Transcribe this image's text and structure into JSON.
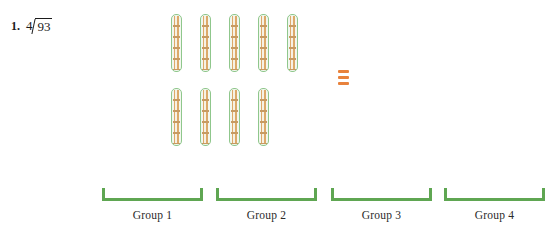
{
  "problem": {
    "number": "1.",
    "divisor": "4",
    "dividend": "93",
    "operator_icon": "long-division-bracket"
  },
  "manipulatives": {
    "rod_rows": [
      {
        "count": 5,
        "label": "ten-rod"
      },
      {
        "count": 4,
        "label": "ten-rod"
      }
    ],
    "total_rods": 9,
    "unit_cubes": 3,
    "rod_border_color": "#8fc78c",
    "rod_fill_color": "#dca96a",
    "unit_cube_color": "#e8823c"
  },
  "groups": [
    {
      "label": "Group 1"
    },
    {
      "label": "Group 2"
    },
    {
      "label": "Group 3"
    },
    {
      "label": "Group 4"
    }
  ],
  "colors": {
    "bracket_green": "#5fa652",
    "text": "#1b1b1b"
  }
}
